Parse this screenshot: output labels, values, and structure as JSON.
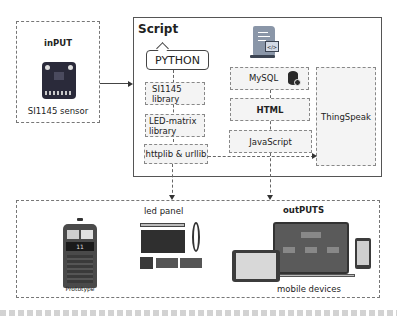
{
  "input": {
    "title": "inPUT",
    "sensor_label": "SI1145 sensor"
  },
  "script": {
    "title": "Script",
    "language": "PYTHON",
    "left_modules": [
      {
        "label_line1": "SI1145",
        "label_line2": "library"
      },
      {
        "label_line1": "LED-matrix",
        "label_line2": "library"
      },
      {
        "label_line1": "httplib & urllib",
        "label_line2": ""
      }
    ],
    "web_modules": [
      {
        "label": "MySQL",
        "icon": "database-gear-icon"
      },
      {
        "label": "HTML"
      },
      {
        "label": "JavaScript"
      }
    ],
    "cloud_service": "ThingSpeak",
    "script_icon": "script-code-icon"
  },
  "outputs": {
    "title": "outPUTS",
    "prototype_label": "Prototype",
    "prototype_display": "11",
    "led_panel_label": "led panel",
    "mobile_label": "mobile devices"
  },
  "colors": {
    "dashed_border": "#888888",
    "box_fill": "#f4f4f4",
    "sensor_board": "#2a2a3a",
    "text": "#222222"
  }
}
